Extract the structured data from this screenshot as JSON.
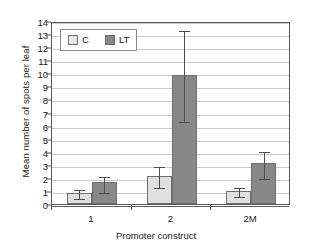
{
  "chart_data": {
    "type": "bar",
    "title": "",
    "xlabel": "Promoter construct",
    "ylabel": "Mean number of spots per leaf",
    "categories": [
      "1",
      "2",
      "2M"
    ],
    "ylim": [
      0,
      14
    ],
    "yticks": [
      0,
      1,
      2,
      3,
      4,
      5,
      6,
      7,
      8,
      9,
      10,
      11,
      12,
      13,
      14
    ],
    "ytick_labels": [
      "0",
      "1",
      "2",
      "3",
      "4",
      "5",
      "6",
      "7",
      "8",
      "9",
      "10",
      "11",
      "12",
      "13",
      "14"
    ],
    "grid": true,
    "legend_position": "top-left",
    "series": [
      {
        "name": "C",
        "color": "#e0e0e0",
        "values": [
          0.88,
          2.18,
          1.0
        ],
        "err_low": [
          0.55,
          1.4,
          0.7
        ],
        "err_high": [
          1.2,
          2.95,
          1.35
        ]
      },
      {
        "name": "LT",
        "color": "#888888",
        "values": [
          1.7,
          9.9,
          3.1
        ],
        "err_low": [
          1.0,
          6.45,
          2.05
        ],
        "err_high": [
          2.25,
          13.4,
          4.15
        ]
      }
    ]
  },
  "legend": {
    "entries": [
      {
        "label": "C"
      },
      {
        "label": "LT"
      }
    ]
  },
  "colors": {
    "series_c": "#e0e0e0",
    "series_lt": "#888888",
    "axis": "#595959",
    "grid": "#c9c9c9",
    "text": "#1a1a1a"
  }
}
